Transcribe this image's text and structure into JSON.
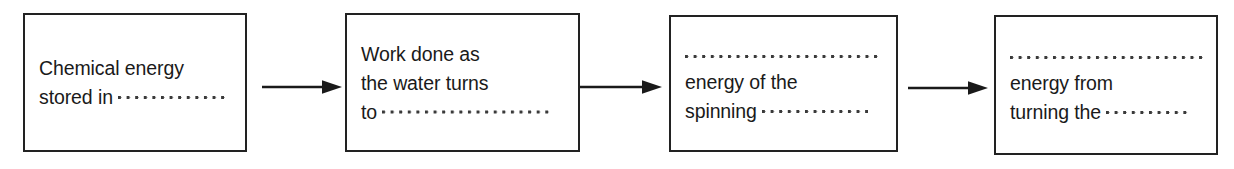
{
  "diagram": {
    "type": "flow-chain",
    "background_color": "#ffffff",
    "border_color": "#222222",
    "text_color": "#1a1a1a",
    "dot_color": "#3a3a3a",
    "boxes": [
      {
        "id": "box-1",
        "lines": [
          {
            "kind": "text",
            "text": "Chemical energy"
          },
          {
            "kind": "text-then-dots",
            "text": "stored in",
            "dots_width": 108
          }
        ]
      },
      {
        "id": "box-2",
        "lines": [
          {
            "kind": "text",
            "text": "Work done as"
          },
          {
            "kind": "text",
            "text": "the water turns"
          },
          {
            "kind": "text-then-dots",
            "text": "to",
            "dots_width": 168
          }
        ]
      },
      {
        "id": "box-3",
        "lines": [
          {
            "kind": "dots-only",
            "dots_width": 196
          },
          {
            "kind": "text",
            "text": "energy of the"
          },
          {
            "kind": "text-then-dots",
            "text": "spinning",
            "dots_width": 106
          }
        ]
      },
      {
        "id": "box-4",
        "lines": [
          {
            "kind": "dots-only",
            "dots_width": 196
          },
          {
            "kind": "text",
            "text": "energy from"
          },
          {
            "kind": "text-then-dots",
            "text": "turning the",
            "dots_width": 82
          }
        ]
      }
    ],
    "arrows": [
      {
        "id": "arrow-1",
        "from": "box-1",
        "to": "box-2",
        "direction": "right"
      },
      {
        "id": "arrow-2",
        "from": "box-2",
        "to": "box-3",
        "direction": "right"
      },
      {
        "id": "arrow-3",
        "from": "box-3",
        "to": "box-4",
        "direction": "right"
      }
    ]
  }
}
